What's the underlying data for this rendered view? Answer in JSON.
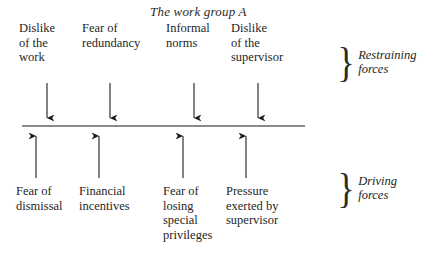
{
  "diagram": {
    "type": "force-field-analysis",
    "title": "The work group A",
    "line_color": "#8a8a8a",
    "arrow_color": "#1a1a1a",
    "restraining": {
      "brace": "}",
      "label": "Restraining\nforces",
      "forces": [
        {
          "label": "Dislike\nof the\nwork"
        },
        {
          "label": "Fear of\nredundancy"
        },
        {
          "label": "Informal\nnorms"
        },
        {
          "label": "Dislike\nof the\nsupervisor"
        }
      ]
    },
    "driving": {
      "brace": "}",
      "label": "Driving\nforces",
      "forces": [
        {
          "label": "Fear of\ndismissal"
        },
        {
          "label": "Financial\nincentives"
        },
        {
          "label": "Fear of\nlosing\nspecial\nprivileges"
        },
        {
          "label": "Pressure\nexerted by\nsupervisor"
        }
      ]
    }
  }
}
